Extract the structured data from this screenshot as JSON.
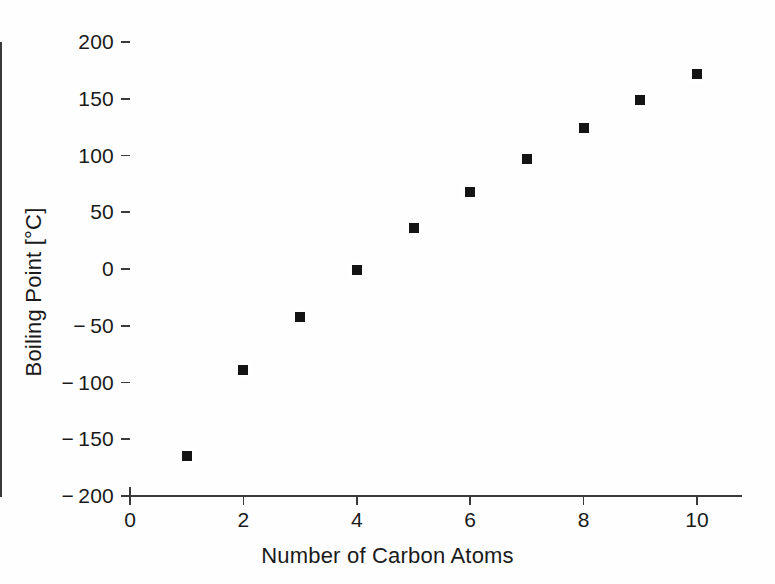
{
  "chart_data": {
    "type": "scatter",
    "title": "",
    "xlabel": "Number of Carbon Atoms",
    "ylabel": "Boiling Point [°C]",
    "xlim": [
      0,
      10.8
    ],
    "ylim": [
      -200,
      200
    ],
    "grid": false,
    "legend": null,
    "marker": "square",
    "marker_color": "#141414",
    "axis_color": "#3a3a3a",
    "background": "#ffffff",
    "xticks": [
      0,
      2,
      4,
      6,
      8,
      10
    ],
    "xtick_labels": [
      "0",
      "2",
      "4",
      "6",
      "8",
      "10"
    ],
    "yticks": [
      200,
      150,
      100,
      50,
      0,
      -50,
      -100,
      -150,
      -200
    ],
    "ytick_labels": [
      "200",
      "150",
      "100",
      "50",
      "0",
      "− 50",
      "− 100",
      "− 150",
      "− 200"
    ],
    "x": [
      1,
      2,
      3,
      4,
      5,
      6,
      7,
      8,
      9,
      10
    ],
    "values": [
      -165,
      -89,
      -42,
      -1,
      36,
      68,
      97,
      124,
      149,
      172
    ],
    "points": [
      {
        "x": 1,
        "y": -165
      },
      {
        "x": 2,
        "y": -89
      },
      {
        "x": 3,
        "y": -42
      },
      {
        "x": 4,
        "y": -1
      },
      {
        "x": 5,
        "y": 36
      },
      {
        "x": 6,
        "y": 68
      },
      {
        "x": 7,
        "y": 97
      },
      {
        "x": 8,
        "y": 124
      },
      {
        "x": 9,
        "y": 149
      },
      {
        "x": 10,
        "y": 172
      }
    ]
  }
}
